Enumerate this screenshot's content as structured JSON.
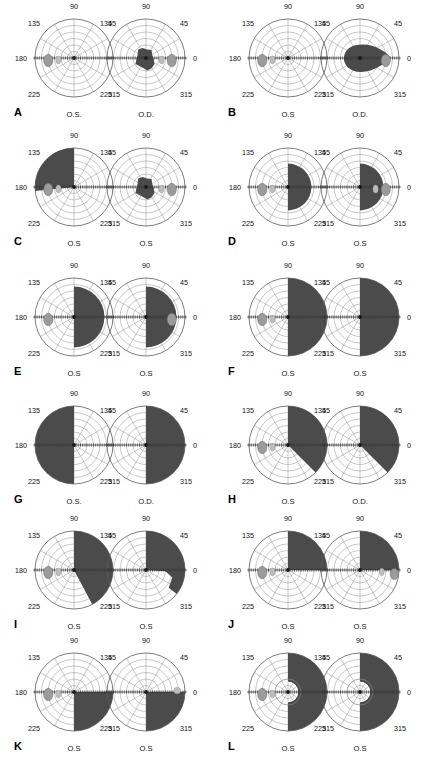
{
  "figure": {
    "panel_letters": [
      "A",
      "B",
      "C",
      "D",
      "E",
      "F",
      "G",
      "H",
      "I",
      "J",
      "K",
      "L"
    ],
    "angle_labels": [
      "0",
      "45",
      "90",
      "135",
      "180",
      "225",
      "315"
    ],
    "eye_labels": {
      "left_eye": "O.S.",
      "right_eye": "O.D."
    },
    "colors": {
      "scotoma_fill": "#4b4b4b",
      "blind_spot": "#9b9b9b",
      "blind_spot_faint": "#bdbdbd",
      "grid": "#9a9a9a",
      "outer_ring": "#5a5a5a",
      "axis": "#3a3a3a",
      "background": "#ffffff",
      "text": "#000000"
    },
    "grid": {
      "rings": 6,
      "spokes": 12,
      "spoke_step_degrees": 30
    }
  },
  "panels": [
    {
      "letter": "A",
      "charts": [
        {
          "eye": "O.S.",
          "angles": [
            "90",
            "135",
            "45",
            "180",
            "225",
            "315"
          ],
          "defect": "none",
          "field_loss_percent": 0
        },
        {
          "eye": "O.D.",
          "angles": [
            "90",
            "135",
            "45",
            "225",
            "315",
            "0"
          ],
          "defect": "central-scotoma",
          "field_loss_percent": 8
        }
      ]
    },
    {
      "letter": "B",
      "charts": [
        {
          "eye": "O.S",
          "angles": [
            "90",
            "135",
            "45",
            "180",
            "225",
            "315"
          ],
          "defect": "none",
          "field_loss_percent": 0
        },
        {
          "eye": "O.D.",
          "angles": [
            "90",
            "135",
            "45",
            "225",
            "315",
            "0"
          ],
          "defect": "large-central-scotoma",
          "field_loss_percent": 22
        }
      ]
    },
    {
      "letter": "C",
      "charts": [
        {
          "eye": "O.S",
          "angles": [
            "90",
            "135",
            "45",
            "180",
            "225",
            "315"
          ],
          "defect": "superior-nasal-quadrant",
          "field_loss_percent": 24
        },
        {
          "eye": "O.S",
          "angles": [
            "90",
            "135",
            "45",
            "225",
            "315",
            "0"
          ],
          "defect": "central-scotoma",
          "field_loss_percent": 9
        }
      ]
    },
    {
      "letter": "D",
      "charts": [
        {
          "eye": "O.S",
          "angles": [
            "90",
            "135",
            "45",
            "180",
            "225",
            "315"
          ],
          "defect": "temporal-hemianopia-partial",
          "field_loss_percent": 26
        },
        {
          "eye": "O.S",
          "angles": [
            "90",
            "135",
            "45",
            "225",
            "315",
            "0"
          ],
          "defect": "temporal-hemianopia-partial",
          "field_loss_percent": 26
        }
      ]
    },
    {
      "letter": "E",
      "charts": [
        {
          "eye": "O.S",
          "angles": [
            "90",
            "135",
            "45",
            "180",
            "225",
            "315"
          ],
          "defect": "hemianopia-central",
          "field_loss_percent": 34
        },
        {
          "eye": "O.S",
          "angles": [
            "90",
            "135",
            "45",
            "225",
            "315",
            "0"
          ],
          "defect": "hemianopia-central",
          "field_loss_percent": 32
        }
      ]
    },
    {
      "letter": "F",
      "charts": [
        {
          "eye": "O.S",
          "angles": [
            "90",
            "135",
            "45",
            "180",
            "225",
            "315"
          ],
          "defect": "complete-hemianopia",
          "field_loss_percent": 50
        },
        {
          "eye": "O.S",
          "angles": [
            "90",
            "135",
            "45",
            "225",
            "315",
            "0"
          ],
          "defect": "complete-hemianopia",
          "field_loss_percent": 50
        }
      ]
    },
    {
      "letter": "G",
      "charts": [
        {
          "eye": "O.S.",
          "angles": [
            "90",
            "135",
            "45",
            "180",
            "225",
            "315"
          ],
          "defect": "complete-hemianopia-nasal",
          "field_loss_percent": 50
        },
        {
          "eye": "O.D.",
          "angles": [
            "90",
            "135",
            "45",
            "225",
            "315",
            "0"
          ],
          "defect": "complete-hemianopia-temporal",
          "field_loss_percent": 50
        }
      ]
    },
    {
      "letter": "H",
      "charts": [
        {
          "eye": "O.S",
          "angles": [
            "90",
            "135",
            "45",
            "180",
            "225",
            "315"
          ],
          "defect": "quadrant-plus-hemianopia",
          "field_loss_percent": 44
        },
        {
          "eye": "O.D.",
          "angles": [
            "90",
            "135",
            "45",
            "225",
            "315",
            "0"
          ],
          "defect": "quadrant-plus-hemianopia",
          "field_loss_percent": 44
        }
      ]
    },
    {
      "letter": "I",
      "charts": [
        {
          "eye": "O.S",
          "angles": [
            "90",
            "135",
            "45",
            "180",
            "225",
            "315"
          ],
          "defect": "hemianopia-wedge-extension",
          "field_loss_percent": 47
        },
        {
          "eye": "O.S",
          "angles": [
            "90",
            "135",
            "45",
            "225",
            "315",
            "0"
          ],
          "defect": "superior-quadrant-notched",
          "field_loss_percent": 30
        }
      ]
    },
    {
      "letter": "J",
      "charts": [
        {
          "eye": "O.S",
          "angles": [
            "90",
            "135",
            "45",
            "180",
            "225",
            "315"
          ],
          "defect": "superior-temporal-quadrant",
          "field_loss_percent": 25
        },
        {
          "eye": "O.S",
          "angles": [
            "90",
            "135",
            "45",
            "225",
            "315",
            "0"
          ],
          "defect": "superior-temporal-quadrant",
          "field_loss_percent": 25
        }
      ]
    },
    {
      "letter": "K",
      "charts": [
        {
          "eye": "O.S",
          "angles": [
            "90",
            "135",
            "45",
            "180",
            "225",
            "315"
          ],
          "defect": "inferior-temporal-quadrant",
          "field_loss_percent": 25
        },
        {
          "eye": "O.S",
          "angles": [
            "90",
            "135",
            "45",
            "225",
            "315",
            "0"
          ],
          "defect": "inferior-temporal-quadrant",
          "field_loss_percent": 25
        }
      ]
    },
    {
      "letter": "L",
      "charts": [
        {
          "eye": "O.S",
          "angles": [
            "90",
            "135",
            "45",
            "180",
            "225",
            "315"
          ],
          "defect": "hemianopia-macular-sparing",
          "field_loss_percent": 46
        },
        {
          "eye": "O.S",
          "angles": [
            "90",
            "135",
            "45",
            "225",
            "315",
            "0"
          ],
          "defect": "hemianopia-macular-sparing",
          "field_loss_percent": 46
        }
      ]
    }
  ]
}
